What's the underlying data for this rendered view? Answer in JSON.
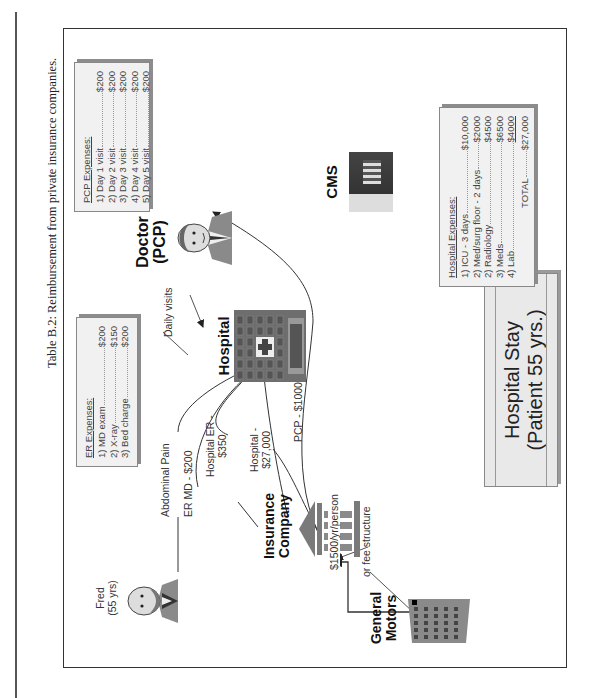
{
  "page": {
    "header_partial": "Table B.2 continuation (cut off)"
  },
  "figure": {
    "caption": "Table B.2:  Reimbursement from private insurance companies.",
    "title_lines": [
      "Hospital Stay",
      "(Patient 55 yrs.)"
    ]
  },
  "nodes": {
    "general_motors": {
      "label_1": "General",
      "label_2": "Motors",
      "icon": "office-building-icon"
    },
    "insurance": {
      "label_1": "Insurance",
      "label_2": "Company",
      "icon": "bank-building-icon"
    },
    "cms": {
      "label": "CMS",
      "icon": "capitol-photo-icon"
    },
    "hospital": {
      "label": "Hospital",
      "icon": "hospital-building-icon"
    },
    "doctor": {
      "label_1": "Doctor",
      "label_2": "(PCP)",
      "icon": "doctor-avatar-icon"
    },
    "fred": {
      "label_1": "Fred",
      "label_2": "(55 yrs)",
      "icon": "patient-avatar-icon"
    }
  },
  "edges": {
    "gm_to_insurance": "$1500/yr/person",
    "fee_structure": "or fee structure",
    "insurance_to_hospital_1": "Hospital -",
    "insurance_to_hospital_2": "$27,000",
    "insurance_to_pcp": "PCP - $1000",
    "insurance_to_er_1": "Hospital ER -",
    "insurance_to_er_2": "$350",
    "insurance_to_ermd": "ER MD - $200",
    "fred_to_hospital": "Abdominal Pain",
    "doctor_to_hospital": "Daily visits"
  },
  "hospital_expenses": {
    "heading": "Hospital Expenses:",
    "items": [
      {
        "label": "1) ICU - 3 days",
        "amount": "$10,000"
      },
      {
        "label": "2) Med/surg floor - 2 days",
        "amount": "$2000"
      },
      {
        "label": "2) Radiology",
        "amount": "$4500"
      },
      {
        "label": "3) Meds",
        "amount": "$6500"
      },
      {
        "label": "4) Lab",
        "amount": "$4000"
      }
    ],
    "total_label": "TOTAL",
    "total_amount": "$27,000"
  },
  "pcp_expenses": {
    "heading": "PCP Expenses:",
    "items": [
      {
        "label": "1) Day 1 visit",
        "amount": "$200"
      },
      {
        "label": "2) Day 2 visit",
        "amount": "$200"
      },
      {
        "label": "3) Day 3 visit",
        "amount": "$200"
      },
      {
        "label": "4) Day 4 visit",
        "amount": "$200"
      },
      {
        "label": "5) Day 5 visit",
        "amount": "$200"
      }
    ]
  },
  "er_expenses": {
    "heading": "ER Expenses:",
    "items": [
      {
        "label": "1) MD exam",
        "amount": "$200"
      },
      {
        "label": "2) X-ray",
        "amount": "$150"
      },
      {
        "label": "3) Bed charge",
        "amount": "$200"
      }
    ]
  },
  "colors": {
    "box_fill": "#efefef",
    "box_border": "#888888",
    "frame": "#333333",
    "icon_gray": "#7a7a7a"
  }
}
